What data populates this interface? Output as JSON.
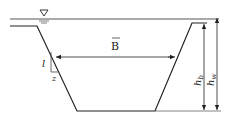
{
  "diagram": {
    "type": "trapezoidal-channel-cross-section",
    "colors": {
      "line": "#222222",
      "background": "#ffffff"
    },
    "water_surface_symbol": "water-level-triangle-icon",
    "labels": {
      "top_width": "B",
      "slope_vertical": "l",
      "slope_horizontal": "z",
      "bank_height": "h",
      "bank_height_sub": "b",
      "water_height": "h",
      "water_height_sub": "w"
    }
  }
}
